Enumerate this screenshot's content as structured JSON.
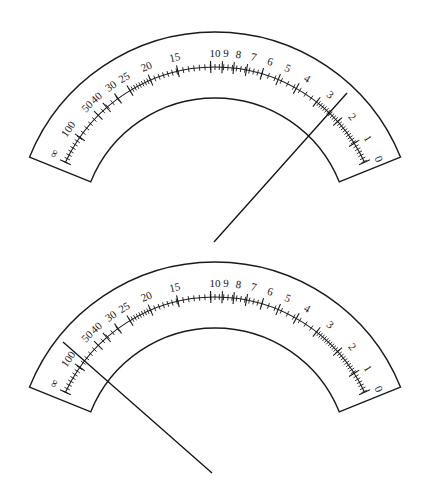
{
  "figure": {
    "type": "ohmmeter-scale-diagram",
    "stroke_color": "#1a1a1a",
    "background": "#ffffff"
  },
  "scale": {
    "outer_radius": 200,
    "inner_radius": 134,
    "scale_radius": 165,
    "label_radius": 178,
    "end_angle_left": -68,
    "end_angle_right": 68,
    "labels": [
      {
        "text": "∞",
        "angle": -64
      },
      {
        "text": "100",
        "angle": -55
      },
      {
        "text": "50",
        "angle": -45.5
      },
      {
        "text": "40",
        "angle": -41.5
      },
      {
        "text": "30",
        "angle": -35.5
      },
      {
        "text": "25",
        "angle": -30.5
      },
      {
        "text": "20",
        "angle": -22.5
      },
      {
        "text": "15",
        "angle": -13
      },
      {
        "text": "10",
        "angle": 0
      },
      {
        "text": "9",
        "angle": 3.5
      },
      {
        "text": "8",
        "angle": 7.5
      },
      {
        "text": "7",
        "angle": 12.5
      },
      {
        "text": "6",
        "angle": 18
      },
      {
        "text": "5",
        "angle": 24
      },
      {
        "text": "4",
        "angle": 31
      },
      {
        "text": "3",
        "angle": 40
      },
      {
        "text": "2",
        "angle": 50
      },
      {
        "text": "1",
        "angle": 58.5
      },
      {
        "text": "0",
        "angle": 66
      }
    ],
    "major_ticks": [
      -65,
      -55,
      -45,
      -41,
      -36,
      -31,
      -23,
      -13,
      -1.5,
      2.5,
      6.5,
      11,
      16.5,
      22.5,
      29.5,
      38,
      48,
      57.5,
      65
    ],
    "minor_tick_ranges": [
      {
        "from": -65,
        "to": -55,
        "step": 1.4
      },
      {
        "from": -55,
        "to": -45,
        "step": 2
      },
      {
        "from": -45,
        "to": -36,
        "step": 2.2
      },
      {
        "from": -31,
        "to": -23,
        "step": 1
      },
      {
        "from": -23,
        "to": -13,
        "step": 1.6
      },
      {
        "from": -13,
        "to": -1.5,
        "step": 1.9
      },
      {
        "from": -1.5,
        "to": 16.5,
        "step": 1.5
      },
      {
        "from": 16.5,
        "to": 38,
        "step": 2.4
      },
      {
        "from": 38,
        "to": 48,
        "step": 0.9
      },
      {
        "from": 48,
        "to": 57.5,
        "step": 1
      },
      {
        "from": 57.5,
        "to": 65,
        "step": 1.2
      }
    ]
  },
  "dials": [
    {
      "name": "top-dial",
      "center": [
        215,
        232
      ],
      "needle": {
        "from": [
          214,
          242
        ],
        "to": [
          347,
          93
        ],
        "reading": "2"
      }
    },
    {
      "name": "bottom-dial",
      "center": [
        215,
        462
      ],
      "needle": {
        "from": [
          212,
          473
        ],
        "to": [
          63,
          342
        ],
        "reading": "100"
      }
    }
  ]
}
